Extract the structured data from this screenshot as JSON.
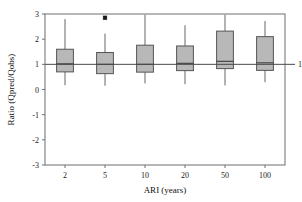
{
  "chart_data": {
    "type": "box",
    "title": "",
    "xlabel": "ARI (years)",
    "ylabel": "Ratio (Qpred/Qobs)",
    "categories": [
      "2",
      "5",
      "10",
      "20",
      "50",
      "100"
    ],
    "ylim": [
      -3,
      3
    ],
    "yticks": [
      3,
      2,
      1,
      0,
      -1,
      -2,
      -3
    ],
    "ytick_labels": [
      "3",
      "2",
      "1",
      "0",
      "-1",
      "-2",
      "-3"
    ],
    "grid": false,
    "legend": "none",
    "reference_line": {
      "value": 1,
      "label": "1",
      "position": "right-outside"
    },
    "box_color": "#b8b8b8",
    "box_edge_color": "#555555",
    "boxes": [
      {
        "category": "2",
        "whisker_low": 0.17,
        "q1": 0.7,
        "median": 1.02,
        "q3": 1.6,
        "whisker_high": 2.8,
        "outliers": []
      },
      {
        "category": "5",
        "whisker_low": 0.15,
        "q1": 0.63,
        "median": 1.0,
        "q3": 1.47,
        "whisker_high": 2.22,
        "outliers": [
          2.85
        ]
      },
      {
        "category": "10",
        "whisker_low": 0.24,
        "q1": 0.69,
        "median": 1.0,
        "q3": 1.76,
        "whisker_high": 2.97,
        "outliers": []
      },
      {
        "category": "20",
        "whisker_low": 0.21,
        "q1": 0.75,
        "median": 1.04,
        "q3": 1.73,
        "whisker_high": 2.55,
        "outliers": []
      },
      {
        "category": "50",
        "whisker_low": 0.16,
        "q1": 0.83,
        "median": 1.12,
        "q3": 2.32,
        "whisker_high": 2.97,
        "outliers": []
      },
      {
        "category": "100",
        "whisker_low": 0.29,
        "q1": 0.76,
        "median": 1.06,
        "q3": 2.1,
        "whisker_high": 2.72,
        "outliers": []
      }
    ]
  }
}
